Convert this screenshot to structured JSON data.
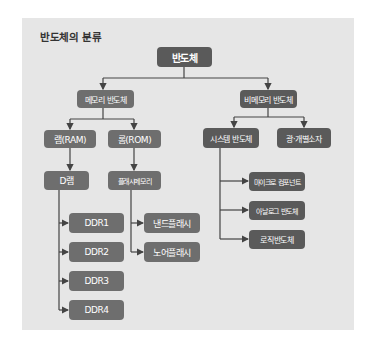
{
  "title": "반도체의 분류",
  "colors": {
    "panel": "#e6e6e6",
    "node_dark": "#5a5a5a",
    "node_mid": "#6e6e6e",
    "line": "#444444",
    "text": "#ffffff"
  },
  "root": {
    "label": "반도체"
  },
  "level1": {
    "memory": {
      "label": "메모리 반도체"
    },
    "non_memory": {
      "label": "비메모리 반도체"
    }
  },
  "memory": {
    "ram": {
      "label": "램(RAM)"
    },
    "rom": {
      "label": "롬(ROM)"
    },
    "dram": {
      "label": "D램"
    },
    "flash": {
      "label": "플래시메모리"
    },
    "ddr": [
      {
        "label": "DDR1"
      },
      {
        "label": "DDR2"
      },
      {
        "label": "DDR3"
      },
      {
        "label": "DDR4"
      }
    ],
    "flash_types": [
      {
        "label": "낸드플래시"
      },
      {
        "label": "노어플래시"
      }
    ]
  },
  "non_memory": {
    "system": {
      "label": "시스템 반도체"
    },
    "optical": {
      "label": "광·개별소자"
    },
    "system_children": [
      {
        "label": "마이크로 컴포넌트"
      },
      {
        "label": "아날로그 반도체"
      },
      {
        "label": "로직반도체"
      }
    ]
  }
}
